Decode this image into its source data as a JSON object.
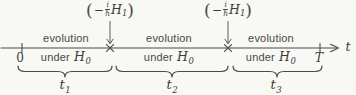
{
  "colors": {
    "background": "#f8f8f5",
    "ink": "#3f3f3f",
    "line": "#4a4a4a"
  },
  "axis": {
    "start_label": "0",
    "end_label": "T",
    "variable_label": "t"
  },
  "interaction_label": {
    "open_paren": "(",
    "minus": "−",
    "frac_numerator": "i",
    "frac_denominator": "ℏ",
    "operator": "H",
    "operator_subscript": "1",
    "close_paren": ")"
  },
  "segments": [
    {
      "top_text": "evolution",
      "bottom_text": "under",
      "hamiltonian": "H",
      "hamiltonian_subscript": "0"
    },
    {
      "top_text": "evolution",
      "bottom_text": "under",
      "hamiltonian": "H",
      "hamiltonian_subscript": "0"
    },
    {
      "top_text": "evolution",
      "bottom_text": "under",
      "hamiltonian": "H",
      "hamiltonian_subscript": "0"
    }
  ],
  "duration_labels": [
    {
      "base": "t",
      "subscript": "1"
    },
    {
      "base": "t",
      "subscript": "2"
    },
    {
      "base": "t",
      "subscript": "3"
    }
  ]
}
